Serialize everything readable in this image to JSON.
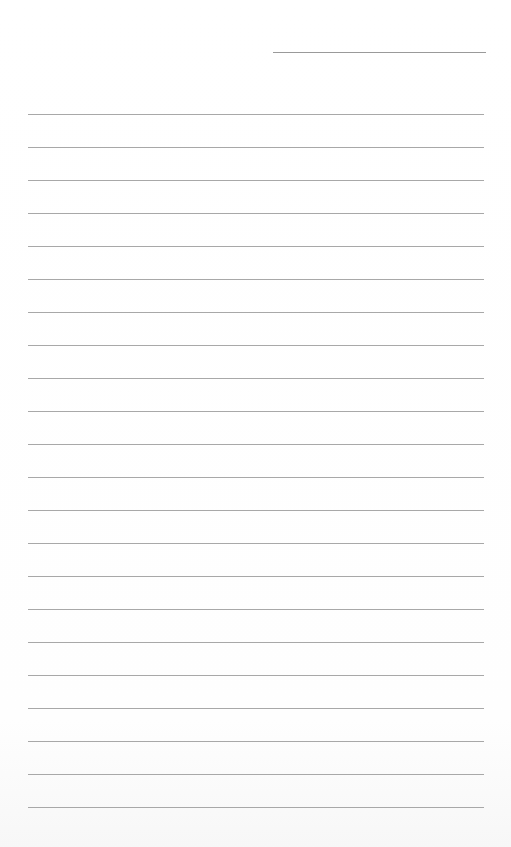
{
  "page": {
    "type": "blank lined paper",
    "header_line": {
      "present": true,
      "position": "top-right"
    },
    "ruled_lines": {
      "count": 22,
      "first_y": 114,
      "spacing": 33
    },
    "line_color": "#a8a8a8",
    "background_color": "#ffffff"
  }
}
